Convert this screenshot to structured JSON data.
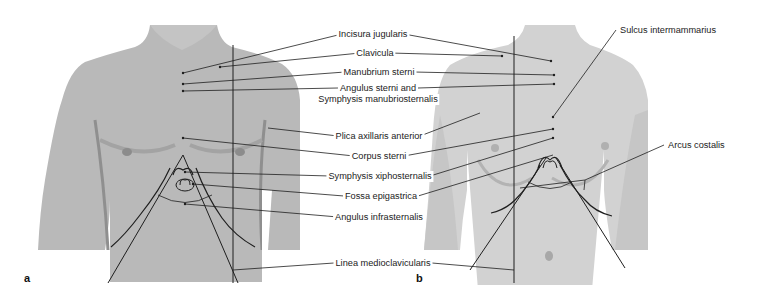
{
  "figure": {
    "panels": [
      {
        "id": "a",
        "label": "a",
        "subject": "male torso, anterior view"
      },
      {
        "id": "b",
        "label": "b",
        "subject": "female torso, anterior view"
      }
    ],
    "center_labels": [
      {
        "key": "incisura_jugularis",
        "text": "Incisura jugularis"
      },
      {
        "key": "clavicula",
        "text": "Clavicula"
      },
      {
        "key": "manubrium_sterni",
        "text": "Manubrium sterni"
      },
      {
        "key": "angulus_sterni_1",
        "text": "Angulus sterni and"
      },
      {
        "key": "angulus_sterni_2",
        "text": "Symphysis manubriosternalis"
      },
      {
        "key": "plica_axillaris",
        "text": "Plica axillaris anterior"
      },
      {
        "key": "corpus_sterni",
        "text": "Corpus sterni"
      },
      {
        "key": "symphysis_xipho",
        "text": "Symphysis xiphosternalis"
      },
      {
        "key": "fossa_epigastrica",
        "text": "Fossa epigastrica"
      },
      {
        "key": "angulus_infrasternalis",
        "text": "Angulus infrasternalis"
      },
      {
        "key": "linea_medioclavicularis",
        "text": "Linea medioclavicularis"
      }
    ],
    "right_labels": [
      {
        "key": "sulcus_intermammarius",
        "text": "Sulcus intermammarius"
      },
      {
        "key": "arcus_costalis",
        "text": "Arcus costalis"
      }
    ],
    "colors": {
      "skin_male": "#b9b9b9",
      "skin_male_dark": "#9a9a9a",
      "skin_female": "#d2d2d2",
      "skin_female_dark": "#b8b8b8",
      "line": "#1e1e1e",
      "text": "#222222"
    }
  }
}
